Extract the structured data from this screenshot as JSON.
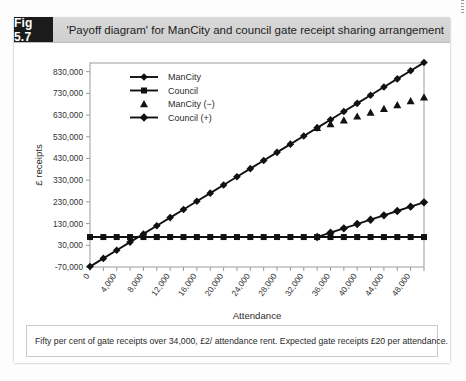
{
  "figure": {
    "badge": "Fig 5.7",
    "title": "'Payoff diagram' for ManCity and council gate receipt sharing arrangement",
    "caption": "Fifty per cent of gate receipts over 34,000, £2/ attendance rent. Expected gate receipts £20 per attendance."
  },
  "colors": {
    "ink": "#111111",
    "badge_bg": "#1b1b1b",
    "badge_text": "#ffffff",
    "header_bg": "#d4d4d4",
    "frame": "#9b9b9b",
    "paper": "#ffffff"
  },
  "chart_data": {
    "type": "line",
    "title": "'Payoff diagram' for ManCity and council gate receipt sharing arrangement",
    "xlabel": "Attendance",
    "ylabel": "£ receipts",
    "xlim": [
      0,
      50000
    ],
    "ylim": [
      -70000,
      870000
    ],
    "grid": false,
    "legend_position": "top-left-inside",
    "x_tick_labels": [
      "0",
      "4,000",
      "8,000",
      "12,000",
      "16,000",
      "20,000",
      "24,000",
      "28,000",
      "32,000",
      "36,000",
      "40,000",
      "44,000",
      "48,000"
    ],
    "x_tick_values": [
      0,
      4000,
      8000,
      12000,
      16000,
      20000,
      24000,
      28000,
      32000,
      36000,
      40000,
      44000,
      48000
    ],
    "x_minor_step": 2000,
    "y_tick_labels": [
      "-70,000",
      "30,000",
      "130,000",
      "230,000",
      "330,000",
      "430,000",
      "530,000",
      "630,000",
      "730,000",
      "830,000"
    ],
    "y_tick_values": [
      -70000,
      30000,
      130000,
      230000,
      330000,
      430000,
      530000,
      630000,
      730000,
      830000
    ],
    "x": [
      0,
      2000,
      4000,
      6000,
      8000,
      10000,
      12000,
      14000,
      16000,
      18000,
      20000,
      22000,
      24000,
      26000,
      28000,
      30000,
      32000,
      34000,
      36000,
      38000,
      40000,
      42000,
      44000,
      46000,
      48000,
      50000
    ],
    "series": [
      {
        "name": "ManCity",
        "marker": "circle",
        "line": true,
        "values": [
          -68000,
          -30400,
          7200,
          44800,
          82400,
          120000,
          157600,
          195200,
          232800,
          270400,
          308000,
          345600,
          383200,
          420800,
          458400,
          496000,
          533600,
          571200,
          608800,
          646400,
          684000,
          721600,
          759200,
          796800,
          834400,
          872000
        ]
      },
      {
        "name": "Council",
        "marker": "square",
        "line": true,
        "values": [
          68000,
          68000,
          68000,
          68000,
          68000,
          68000,
          68000,
          68000,
          68000,
          68000,
          68000,
          68000,
          68000,
          68000,
          68000,
          68000,
          68000,
          68000,
          68000,
          68000,
          68000,
          68000,
          68000,
          68000,
          68000,
          68000
        ]
      },
      {
        "name": "ManCity (−)",
        "marker": "triangle",
        "line": false,
        "values": [
          null,
          null,
          null,
          null,
          null,
          null,
          null,
          null,
          null,
          null,
          null,
          null,
          null,
          null,
          null,
          null,
          null,
          571200,
          588800,
          606400,
          624000,
          641600,
          659200,
          676800,
          694400,
          712000
        ]
      },
      {
        "name": "Council (+)",
        "marker": "diamond",
        "line": true,
        "values": [
          null,
          null,
          null,
          null,
          null,
          null,
          null,
          null,
          null,
          null,
          null,
          null,
          null,
          null,
          null,
          null,
          null,
          68000,
          88000,
          108000,
          128000,
          148000,
          168000,
          188000,
          208000,
          228000
        ]
      }
    ],
    "annotations": [
      {
        "text": "Split point at attendance 34,000",
        "x": 34000
      }
    ]
  }
}
